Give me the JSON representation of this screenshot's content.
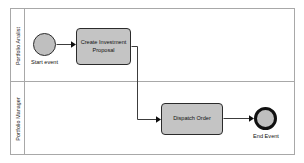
{
  "diagram": {
    "type": "bpmn-process",
    "pool": {
      "lanes": [
        {
          "id": "lane-analyst",
          "label": "Portfolio Analist"
        },
        {
          "id": "lane-manager",
          "label": "Portfolio Manager"
        }
      ]
    },
    "nodes": [
      {
        "id": "start-event",
        "type": "start-event",
        "label": "Start event",
        "lane": "lane-analyst"
      },
      {
        "id": "task-create",
        "type": "task",
        "label": "Create Investment Proposal",
        "lane": "lane-analyst"
      },
      {
        "id": "task-dispatch",
        "type": "task",
        "label": "Dispatch Order",
        "lane": "lane-manager"
      },
      {
        "id": "end-event",
        "type": "end-event",
        "label": "End Event",
        "lane": "lane-manager"
      }
    ],
    "flows": [
      {
        "id": "flow-1",
        "from": "start-event",
        "to": "task-create"
      },
      {
        "id": "flow-2",
        "from": "task-create",
        "to": "task-dispatch"
      },
      {
        "id": "flow-3",
        "from": "task-dispatch",
        "to": "end-event"
      }
    ],
    "colors": {
      "shape_fill": "#c4c4c4",
      "event_fill": "#bfbfbf",
      "shape_stroke": "#2b2b2b",
      "end_event_stroke": "#101010",
      "pool_stroke": "#a8a8a8",
      "connector": "#3c3c3c",
      "background": "#ffffff"
    }
  }
}
